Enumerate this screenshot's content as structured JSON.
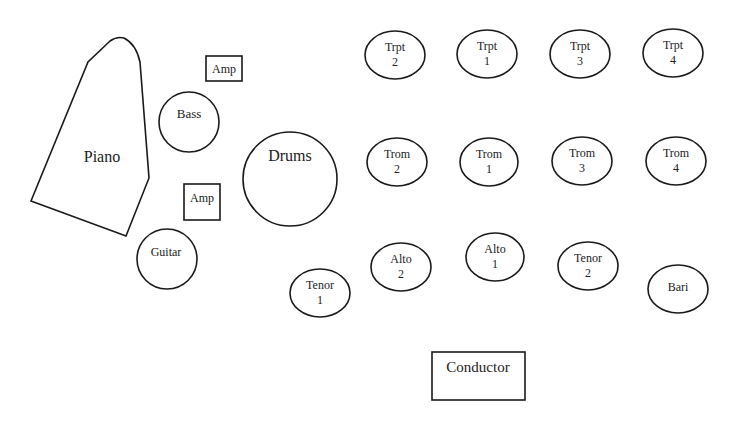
{
  "diagram": {
    "rhythm_section": {
      "piano": {
        "label": "Piano"
      },
      "amp_bass": {
        "label": "Amp"
      },
      "bass": {
        "label": "Bass"
      },
      "amp_guitar": {
        "label": "Amp"
      },
      "drums": {
        "label": "Drums"
      },
      "guitar": {
        "label": "Guitar"
      }
    },
    "trumpets": [
      {
        "name": "Trpt",
        "num": "2"
      },
      {
        "name": "Trpt",
        "num": "1"
      },
      {
        "name": "Trpt",
        "num": "3"
      },
      {
        "name": "Trpt",
        "num": "4"
      }
    ],
    "trombones": [
      {
        "name": "Trom",
        "num": "2"
      },
      {
        "name": "Trom",
        "num": "1"
      },
      {
        "name": "Trom",
        "num": "3"
      },
      {
        "name": "Trom",
        "num": "4"
      }
    ],
    "saxes": [
      {
        "name": "Tenor",
        "num": "1"
      },
      {
        "name": "Alto",
        "num": "2"
      },
      {
        "name": "Alto",
        "num": "1"
      },
      {
        "name": "Tenor",
        "num": "2"
      },
      {
        "name": "Bari",
        "num": ""
      }
    ],
    "conductor": {
      "label": "Conductor"
    },
    "colors": {
      "stroke": "#1a1a1a",
      "fill": "#ffffff",
      "text": "#222222"
    }
  }
}
